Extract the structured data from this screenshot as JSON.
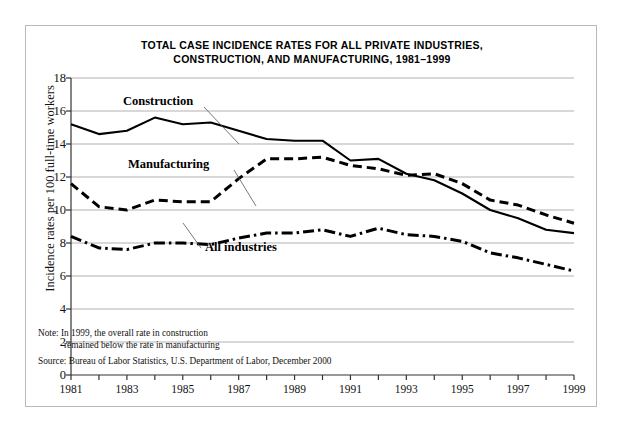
{
  "title_line1": "TOTAL CASE INCIDENCE RATES FOR ALL PRIVATE INDUSTRIES,",
  "title_line2": "CONSTRUCTION, AND MANUFACTURING, 1981–1999",
  "note_line1": "Note: In 1999, the overall rate in construction",
  "note_line2": "remained below the rate in manufacturing",
  "source": "Source: Bureau of Labor Statistics, U.S. Department of Labor, December 2000",
  "annotations": {
    "construction": "Construction",
    "manufacturing": "Manufacturing",
    "all_industries": "All industries"
  },
  "chart_data": {
    "type": "line",
    "title": "TOTAL CASE INCIDENCE RATES FOR ALL PRIVATE INDUSTRIES, CONSTRUCTION, AND MANUFACTURING, 1981–1999",
    "xlabel": "",
    "ylabel": "Incidence rates per 100 full-time workers",
    "x": [
      1981,
      1982,
      1983,
      1984,
      1985,
      1986,
      1987,
      1988,
      1989,
      1990,
      1991,
      1992,
      1993,
      1994,
      1995,
      1996,
      1997,
      1998,
      1999
    ],
    "xlim": [
      1981,
      1999
    ],
    "ylim": [
      0,
      18
    ],
    "yticks": [
      0,
      2,
      4,
      6,
      8,
      10,
      12,
      14,
      16,
      18
    ],
    "xticks_labeled": [
      1981,
      1983,
      1985,
      1987,
      1989,
      1991,
      1993,
      1995,
      1997,
      1999
    ],
    "grid": "horizontal",
    "legend": "inline-annotations",
    "series": [
      {
        "name": "Construction",
        "style": "solid",
        "color": "#000000",
        "values": [
          15.2,
          14.6,
          14.8,
          15.6,
          15.2,
          15.3,
          14.8,
          14.3,
          14.2,
          14.2,
          13.0,
          13.1,
          12.2,
          11.8,
          11.0,
          10.0,
          9.5,
          8.8,
          8.6
        ]
      },
      {
        "name": "Manufacturing",
        "style": "dashed",
        "color": "#000000",
        "values": [
          11.6,
          10.2,
          10.0,
          10.6,
          10.5,
          10.5,
          11.9,
          13.1,
          13.1,
          13.2,
          12.7,
          12.5,
          12.1,
          12.2,
          11.6,
          10.6,
          10.3,
          9.7,
          9.2
        ]
      },
      {
        "name": "All industries",
        "style": "dash-dot",
        "color": "#000000",
        "values": [
          8.4,
          7.7,
          7.6,
          8.0,
          8.0,
          7.9,
          8.3,
          8.6,
          8.6,
          8.8,
          8.4,
          8.9,
          8.5,
          8.4,
          8.1,
          7.4,
          7.1,
          6.7,
          6.3
        ]
      }
    ]
  }
}
